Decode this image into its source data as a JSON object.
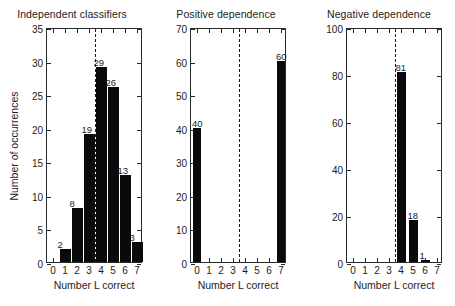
{
  "figure": {
    "background": "#ffffff",
    "bar_color": "#0a0a0a",
    "axis_color": "#2a2a2a",
    "refline_color": "#1a1a1a"
  },
  "chart_data": [
    {
      "type": "bar",
      "title": "Independent classifiers",
      "xlabel": "Number L correct",
      "ylabel": "Number of occurrences",
      "categories": [
        "0",
        "1",
        "2",
        "3",
        "4",
        "5",
        "6",
        "7"
      ],
      "values": [
        0,
        2,
        8,
        19,
        29,
        26,
        13,
        3
      ],
      "bar_labels": [
        "",
        "2",
        "8",
        "19",
        "29",
        "26",
        "13",
        "3"
      ],
      "ylim": [
        0,
        35
      ],
      "yticks": [
        "0",
        "5",
        "10",
        "15",
        "20",
        "25",
        "30",
        "35"
      ],
      "ytick_values": [
        0,
        5,
        10,
        15,
        20,
        25,
        30,
        35
      ],
      "xlim": [
        -0.5,
        7.5
      ],
      "xticks": [
        "0",
        "1",
        "2",
        "3",
        "4",
        "5",
        "6",
        "7"
      ],
      "grid": false,
      "legend": "none",
      "annotations": [
        {
          "kind": "vertical-dashed-line",
          "x": 3.5,
          "style": "dashed"
        }
      ]
    },
    {
      "type": "bar",
      "title": "Positive dependence",
      "xlabel": "Number L correct",
      "ylabel": "",
      "categories": [
        "0",
        "1",
        "2",
        "3",
        "4",
        "5",
        "6",
        "7"
      ],
      "values": [
        40,
        0,
        0,
        0,
        0,
        0,
        0,
        60
      ],
      "bar_labels": [
        "40",
        "",
        "",
        "",
        "",
        "",
        "",
        "60"
      ],
      "ylim": [
        0,
        70
      ],
      "yticks": [
        "0",
        "10",
        "20",
        "30",
        "40",
        "50",
        "60",
        "70"
      ],
      "ytick_values": [
        0,
        10,
        20,
        30,
        40,
        50,
        60,
        70
      ],
      "xlim": [
        -0.5,
        7.5
      ],
      "xticks": [
        "0",
        "1",
        "2",
        "3",
        "4",
        "5",
        "6",
        "7"
      ],
      "grid": false,
      "legend": "none",
      "annotations": [
        {
          "kind": "vertical-dashed-line",
          "x": 3.5,
          "style": "dashed"
        }
      ]
    },
    {
      "type": "bar",
      "title": "Negative dependence",
      "xlabel": "Number L correct",
      "ylabel": "",
      "categories": [
        "0",
        "1",
        "2",
        "3",
        "4",
        "5",
        "6",
        "7"
      ],
      "values": [
        0,
        0,
        0,
        0,
        81,
        18,
        1,
        0
      ],
      "bar_labels": [
        "",
        "",
        "",
        "",
        "81",
        "18",
        "1",
        ""
      ],
      "ylim": [
        0,
        100
      ],
      "yticks": [
        "0",
        "20",
        "40",
        "60",
        "80",
        "100"
      ],
      "ytick_values": [
        0,
        20,
        40,
        60,
        80,
        100
      ],
      "xlim": [
        -0.5,
        7.5
      ],
      "xticks": [
        "0",
        "1",
        "2",
        "3",
        "4",
        "5",
        "6",
        "7"
      ],
      "grid": false,
      "legend": "none",
      "annotations": [
        {
          "kind": "vertical-dashed-line",
          "x": 3.5,
          "style": "dashed"
        }
      ]
    }
  ]
}
